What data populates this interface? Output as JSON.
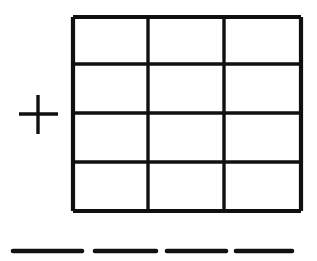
{
  "figure": {
    "background_color": "#ffffff",
    "ink_color": "#101010",
    "canvas": {
      "width": 317,
      "height": 261
    }
  },
  "plus_sign": {
    "name": "plus-sign",
    "center_x": 38,
    "center_y": 114,
    "horizontal": {
      "x1": 19,
      "y1": 114,
      "x2": 58,
      "y2": 114
    },
    "vertical": {
      "x1": 38,
      "y1": 95,
      "x2": 38,
      "y2": 134
    },
    "stroke_width": 3.4
  },
  "grid": {
    "name": "rectangular-grid",
    "columns": 3,
    "rows": 4,
    "left": 73,
    "top": 17,
    "right": 301,
    "bottom": 211,
    "width": 228,
    "height": 194,
    "outer_stroke_width": 4.2,
    "inner_stroke_width": 3.4,
    "vertical_dividers_x": [
      148,
      224
    ],
    "horizontal_dividers_y": [
      64,
      113,
      162
    ],
    "outer_edges": {
      "top": {
        "x1": 73,
        "y1": 17,
        "x2": 301,
        "y2": 17
      },
      "right": {
        "x1": 301,
        "y1": 17,
        "x2": 301,
        "y2": 211
      },
      "bottom": {
        "x1": 73,
        "y1": 211,
        "x2": 301,
        "y2": 211
      },
      "left": {
        "x1": 73,
        "y1": 17,
        "x2": 73,
        "y2": 211
      }
    },
    "cells": [
      [
        {
          "row": 1,
          "col": 1
        },
        {
          "row": 1,
          "col": 2
        },
        {
          "row": 1,
          "col": 3
        }
      ],
      [
        {
          "row": 2,
          "col": 1
        },
        {
          "row": 2,
          "col": 2
        },
        {
          "row": 2,
          "col": 3
        }
      ],
      [
        {
          "row": 3,
          "col": 1
        },
        {
          "row": 3,
          "col": 2
        },
        {
          "row": 3,
          "col": 3
        }
      ],
      [
        {
          "row": 4,
          "col": 1
        },
        {
          "row": 4,
          "col": 2
        },
        {
          "row": 4,
          "col": 3
        }
      ]
    ]
  },
  "dashes": {
    "name": "bottom-dashes",
    "count": 4,
    "stroke_width": 4.6,
    "items": [
      {
        "index": 1,
        "x1": 13,
        "y1": 251,
        "x2": 82,
        "y2": 251
      },
      {
        "index": 2,
        "x1": 95,
        "y1": 251,
        "x2": 156,
        "y2": 251
      },
      {
        "index": 3,
        "x1": 167,
        "y1": 251,
        "x2": 226,
        "y2": 251
      },
      {
        "index": 4,
        "x1": 236,
        "y1": 251,
        "x2": 292,
        "y2": 251
      }
    ]
  }
}
